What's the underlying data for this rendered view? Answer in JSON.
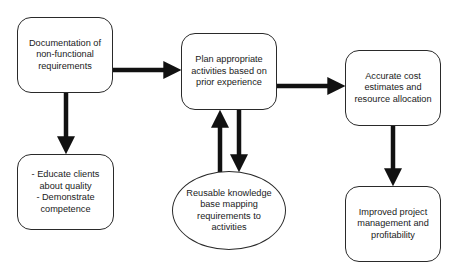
{
  "diagram": {
    "type": "flowchart",
    "colors": {
      "stroke": "#111111",
      "box_border": "#2a2a2a",
      "text": "#1a1a1a",
      "background": "#ffffff"
    },
    "nodes": [
      {
        "id": "documentation",
        "shape": "rounded-rect",
        "label": "Documentation of\nnon-functional\nrequirements"
      },
      {
        "id": "plan",
        "shape": "rounded-rect",
        "label": "Plan appropriate\nactivities based on\nprior experience"
      },
      {
        "id": "estimates",
        "shape": "rounded-rect",
        "label": "Accurate cost\nestimates and\nresource allocation"
      },
      {
        "id": "educate",
        "shape": "rounded-rect",
        "label": "- Educate clients\nabout quality\n- Demonstrate\ncompetence"
      },
      {
        "id": "knowledge_base",
        "shape": "ellipse",
        "label": "Reusable knowledge\nbase mapping\nrequirements to\nactivities"
      },
      {
        "id": "improved",
        "shape": "rounded-rect",
        "label": "Improved project\nmanagement and\nprofitability"
      }
    ],
    "edges": [
      {
        "from": "documentation",
        "to": "plan"
      },
      {
        "from": "plan",
        "to": "estimates"
      },
      {
        "from": "documentation",
        "to": "educate"
      },
      {
        "from": "knowledge_base",
        "to": "plan"
      },
      {
        "from": "plan",
        "to": "knowledge_base"
      },
      {
        "from": "estimates",
        "to": "improved"
      }
    ]
  }
}
